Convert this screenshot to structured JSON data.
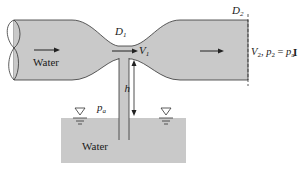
{
  "figure": {
    "colors": {
      "water_fill": "#c9c9c9",
      "outline": "#333333",
      "background": "#ffffff",
      "text": "#1a1a1a"
    },
    "labels": {
      "pipe_fluid": "Water",
      "tank_fluid": "Water",
      "throat_diameter": "D",
      "throat_diameter_sub": "1",
      "exit_diameter": "D",
      "exit_diameter_sub": "2",
      "throat_velocity": "V",
      "throat_velocity_sub": "1",
      "exit_velocity": "V",
      "exit_velocity_sub": "2",
      "exit_pressure_sep": ", ",
      "exit_pressure": "p",
      "exit_pressure_sub": "2",
      "equals": " = ",
      "atm_pressure": "p",
      "atm_pressure_sub": "a",
      "tank_pressure": "p",
      "tank_pressure_sub": "a",
      "height": "h",
      "figure_mark": "I"
    },
    "icons": {
      "flow_arrow": "right-arrow",
      "free_surface": "inverted-triangle"
    }
  }
}
